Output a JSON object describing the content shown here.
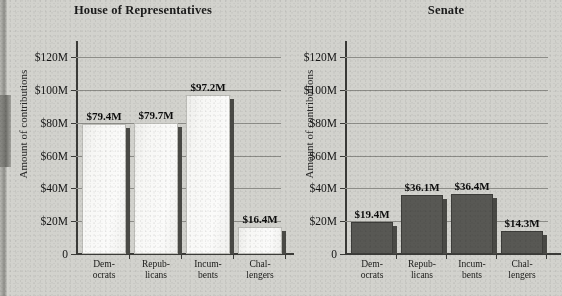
{
  "figure": {
    "y_axis_label": "Amount of contributions",
    "y_ticks": [
      "$120M",
      "$100M",
      "$80M",
      "$60M",
      "$40M",
      "$20M",
      "0"
    ],
    "y_tick_values": [
      120,
      100,
      80,
      60,
      40,
      20,
      0
    ],
    "categories_line1": [
      "Dem-",
      "Repub-",
      "Incum-",
      "Chal-"
    ],
    "categories_line2": [
      "ocrats",
      "licans",
      "bents",
      "lengers"
    ],
    "colors": {
      "background": "#d2d2cd",
      "house_bar": "#f7f7f5",
      "senate_bar": "#585854",
      "axis": "#3b3b38",
      "gridline": "#8d8d88",
      "text": "#141414"
    }
  },
  "chart_data": [
    {
      "type": "bar",
      "title": "House of Representatives",
      "xlabel": "",
      "ylabel": "Amount of contributions",
      "ylim": [
        0,
        130
      ],
      "grid": true,
      "legend": "none",
      "categories": [
        "Dem-ocrats",
        "Repub-licans",
        "Incum-bents",
        "Chal-lengers"
      ],
      "values": [
        79.4,
        79.7,
        97.2,
        16.4
      ],
      "data_labels": [
        "$79.4M",
        "$79.7M",
        "$97.2M",
        "$16.4M"
      ],
      "units": "millions of USD",
      "bar_style": "light"
    },
    {
      "type": "bar",
      "title": "Senate",
      "xlabel": "",
      "ylabel": "Amount of contributions",
      "ylim": [
        0,
        130
      ],
      "grid": true,
      "legend": "none",
      "categories": [
        "Dem-ocrats",
        "Repub-licans",
        "Incum-bents",
        "Chal-lengers"
      ],
      "values": [
        19.4,
        36.1,
        36.4,
        14.3
      ],
      "data_labels": [
        "$19.4M",
        "$36.1M",
        "$36.4M",
        "$14.3M"
      ],
      "units": "millions of USD",
      "bar_style": "dark"
    }
  ]
}
